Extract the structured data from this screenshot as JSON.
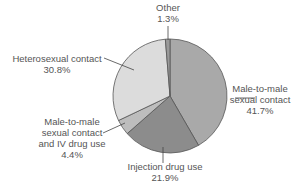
{
  "chart_data": {
    "type": "pie",
    "title": "",
    "start": "top",
    "direction": "clockwise",
    "slices": [
      {
        "label_lines": [
          "Male-to-male",
          "sexual contact"
        ],
        "value": 41.7,
        "value_label": "41.7%",
        "color": "#a9a9a9"
      },
      {
        "label_lines": [
          "Injection drug use"
        ],
        "value": 21.9,
        "value_label": "21.9%",
        "color": "#8c8c8c"
      },
      {
        "label_lines": [
          "Male-to-male",
          "sexual contact",
          "and IV drug use"
        ],
        "value": 4.4,
        "value_label": "4.4%",
        "color": "#bdbdbd"
      },
      {
        "label_lines": [
          "Heterosexual contact"
        ],
        "value": 30.8,
        "value_label": "30.8%",
        "color": "#dcdcdc"
      },
      {
        "label_lines": [
          "Other"
        ],
        "value": 1.3,
        "value_label": "1.3%",
        "color": "#9a9a9a"
      }
    ],
    "edge_color": "#555555",
    "label_color": "#555555"
  }
}
